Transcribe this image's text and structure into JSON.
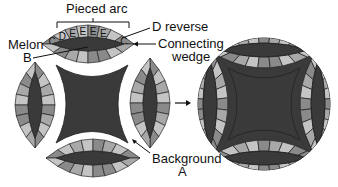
{
  "diagram": {
    "labels": {
      "pieced_arc": "Pieced arc",
      "d_reverse": "D reverse",
      "melon_line1": "Melon",
      "melon_line2": "B",
      "connecting_line1": "Connecting",
      "connecting_line2": "wedge",
      "background_line1": "Background",
      "background_line2": "A"
    },
    "arc_piece_letters": [
      "C",
      "D",
      "E",
      "E",
      "E",
      "E",
      "",
      "C"
    ],
    "colors": {
      "dark_fabric": "#3a3a3a",
      "medium_gray": "#8a8a8a",
      "light_gray": "#c4c4c4",
      "mid_light_gray": "#a8a8a8",
      "outline": "#222222",
      "background": "#ffffff"
    },
    "parts": [
      "Pieced arc",
      "Melon B",
      "Connecting wedge",
      "D reverse",
      "Background A"
    ],
    "arrow": "assembled-block"
  }
}
